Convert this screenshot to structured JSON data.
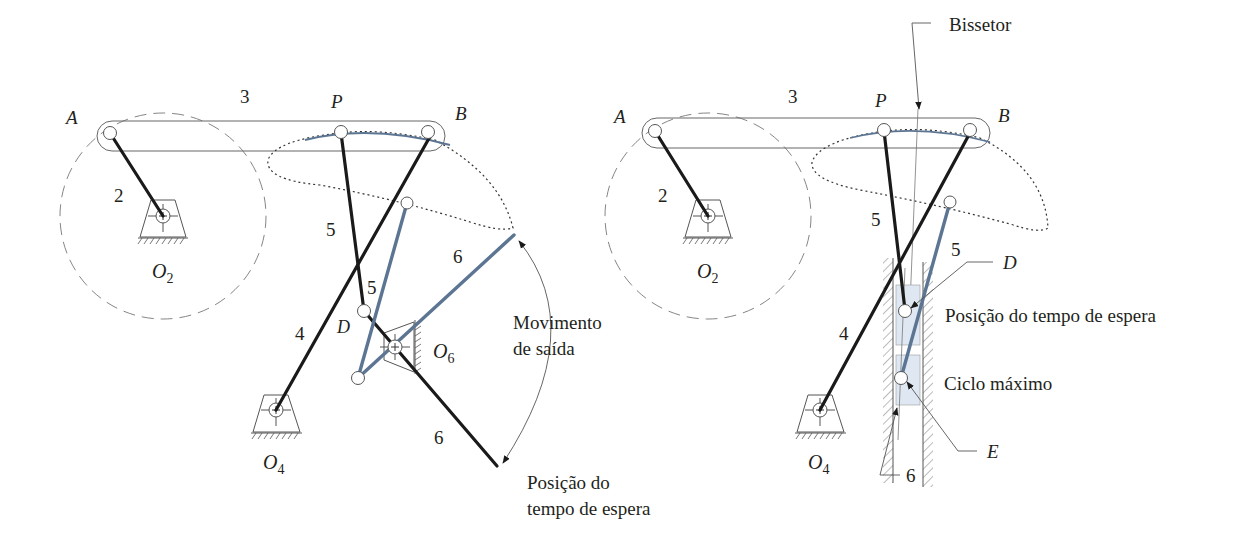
{
  "figure": {
    "left_panel": {
      "labels": {
        "A": "A",
        "B": "B",
        "P": "P",
        "D": "D",
        "link2": "2",
        "link3": "3",
        "link4": "4",
        "link5_black": "5",
        "link5_blue": "5",
        "link6_blue": "6",
        "link6_black": "6",
        "O2": "O",
        "O2_sub": "2",
        "O4": "O",
        "O4_sub": "4",
        "O6": "O",
        "O6_sub": "6"
      },
      "annotations": {
        "output_motion_line1": "Movimento",
        "output_motion_line2": "de saída",
        "dwell_position_line1": "Posição do",
        "dwell_position_line2": "tempo de espera"
      }
    },
    "right_panel": {
      "labels": {
        "A": "A",
        "B": "B",
        "P": "P",
        "D": "D",
        "E": "E",
        "link2": "2",
        "link3": "3",
        "link4": "4",
        "link5_black": "5",
        "link5_blue": "5",
        "link6": "6",
        "O2": "O",
        "O2_sub": "2",
        "O4": "O",
        "O4_sub": "4"
      },
      "annotations": {
        "bisector": "Bissetor",
        "dwell_position": "Posição do tempo de espera",
        "max_cycle": "Ciclo máximo"
      }
    },
    "colors": {
      "black_links": "#1a1a1a",
      "blue_links": "#5b7593",
      "slider_fill": "#dfe8f2"
    }
  }
}
